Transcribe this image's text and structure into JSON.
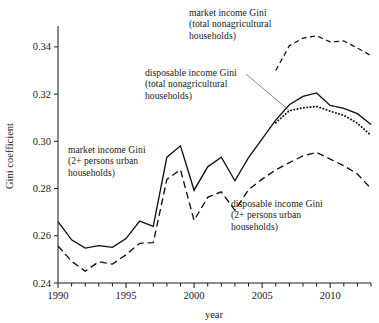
{
  "chart_data": {
    "type": "line",
    "title": "",
    "xlabel": "year",
    "ylabel": "Gini coefficient",
    "xlim": [
      1990,
      2013
    ],
    "ylim": [
      0.24,
      0.348
    ],
    "grid": false,
    "legend_position": "inline-annotations",
    "x_ticks": [
      1990,
      1995,
      2000,
      2005,
      2010
    ],
    "x_tick_labels": [
      "1990",
      "1995",
      "2000",
      "2005",
      "2010"
    ],
    "x_minor_tick_interval": 1,
    "y_ticks": [
      0.24,
      0.26,
      0.28,
      0.3,
      0.32,
      0.34
    ],
    "y_tick_labels": [
      "0.24",
      "0.26",
      "0.28",
      "0.30",
      "0.32",
      "0.34"
    ],
    "series": [
      {
        "name": "market income Gini (2+ persons urban households)",
        "style": "solid",
        "x": [
          1990,
          1991,
          1992,
          1993,
          1994,
          1995,
          1996,
          1997,
          1998,
          1999,
          2000,
          2001,
          2002,
          2003,
          2004,
          2005,
          2006,
          2007,
          2008,
          2009,
          2010,
          2011,
          2012,
          2013
        ],
        "values": [
          0.266,
          0.2583,
          0.2548,
          0.2558,
          0.2551,
          0.2588,
          0.2662,
          0.264,
          0.2933,
          0.2981,
          0.2793,
          0.2892,
          0.2933,
          0.2833,
          0.2931,
          0.301,
          0.309,
          0.3155,
          0.319,
          0.3205,
          0.3152,
          0.314,
          0.3117,
          0.3071
        ]
      },
      {
        "name": "disposable income Gini (2+ persons urban households)",
        "style": "dashed",
        "x": [
          1990,
          1991,
          1992,
          1993,
          1994,
          1995,
          1996,
          1997,
          1998,
          1999,
          2000,
          2001,
          2002,
          2003,
          2004,
          2005,
          2006,
          2007,
          2008,
          2009,
          2010,
          2011,
          2012,
          2013
        ],
        "values": [
          0.2557,
          0.2492,
          0.245,
          0.249,
          0.248,
          0.252,
          0.2568,
          0.2571,
          0.2839,
          0.288,
          0.2665,
          0.2763,
          0.2786,
          0.2708,
          0.2795,
          0.284,
          0.2879,
          0.291,
          0.2938,
          0.2953,
          0.2925,
          0.2897,
          0.2862,
          0.28
        ]
      },
      {
        "name": "market income Gini (total nonagricultural households)",
        "style": "dashed-short",
        "x": [
          2006,
          2007,
          2008,
          2009,
          2010,
          2011,
          2012,
          2013
        ],
        "values": [
          0.33,
          0.3405,
          0.3437,
          0.3447,
          0.3421,
          0.3425,
          0.3395,
          0.3363
        ]
      },
      {
        "name": "disposable income Gini (total nonagricultural households)",
        "style": "dotted",
        "x": [
          2006,
          2007,
          2008,
          2009,
          2010,
          2011,
          2012,
          2013
        ],
        "values": [
          0.3079,
          0.313,
          0.3142,
          0.3148,
          0.3128,
          0.311,
          0.3077,
          0.3025
        ]
      }
    ],
    "annotations": [
      {
        "id": "market-total",
        "lines": [
          "market income Gini",
          "(total nonagricultural",
          "households)"
        ],
        "target_series": "market income Gini (total nonagricultural households)",
        "leader": false
      },
      {
        "id": "disposable-total",
        "lines": [
          "disposable income Gini",
          "(total nonagricultural",
          "households)"
        ],
        "target_series": "disposable income Gini (total nonagricultural households)",
        "leader": true
      },
      {
        "id": "market-urban",
        "lines": [
          "market income Gini",
          "(2+ persons urban",
          "households)"
        ],
        "target_series": "market income Gini (2+ persons urban households)",
        "leader": false
      },
      {
        "id": "disposable-urban",
        "lines": [
          "disposable income Gini",
          "(2+ persons urban",
          "households)"
        ],
        "target_series": "disposable income Gini (2+ persons urban households)",
        "leader": false
      }
    ],
    "colors": {
      "line": "#111111",
      "axis": "#1a1a1a",
      "background": "#ffffff",
      "leader": "#555555"
    }
  }
}
